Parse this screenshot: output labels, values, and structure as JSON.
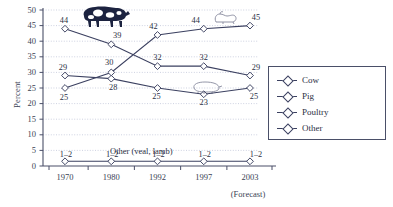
{
  "chart_data": {
    "type": "line",
    "title": "",
    "xlabel": "",
    "ylabel": "Percent",
    "categories": [
      "1970",
      "1980",
      "1992",
      "1997",
      "2003"
    ],
    "forecast_note": "(Forecast)",
    "ylim": [
      0,
      50
    ],
    "yticks": [
      0,
      5,
      10,
      15,
      20,
      25,
      30,
      35,
      40,
      45,
      50
    ],
    "grid": true,
    "legend_position": "right",
    "series": [
      {
        "name": "Cow",
        "values": [
          44,
          39,
          32,
          32,
          29
        ],
        "labels": [
          "44",
          "39",
          "32",
          "32",
          "29"
        ],
        "color": "#3b4060"
      },
      {
        "name": "Pig",
        "values": [
          29,
          28,
          25,
          23,
          25
        ],
        "labels": [
          "29",
          "28",
          "25",
          "23",
          "25"
        ],
        "color": "#3b4060"
      },
      {
        "name": "Poultry",
        "values": [
          25,
          30,
          42,
          44,
          45
        ],
        "labels": [
          "25",
          "30",
          "42",
          "44",
          "45"
        ],
        "color": "#3b4060"
      },
      {
        "name": "Other",
        "values": [
          1.5,
          1.5,
          1.5,
          1.5,
          1.5
        ],
        "labels": [
          "1–2",
          "1–2",
          "1–2",
          "1–2",
          "1–2"
        ],
        "color": "#3b4060"
      }
    ],
    "annotations": [
      {
        "name": "other-series-note",
        "text": "Other (veal, lamb)"
      }
    ],
    "clipart": [
      {
        "name": "cow-clipart"
      },
      {
        "name": "chicken-clipart"
      },
      {
        "name": "pig-clipart"
      }
    ]
  },
  "legend": {
    "items": [
      {
        "label": "Cow"
      },
      {
        "label": "Pig"
      },
      {
        "label": "Poultry"
      },
      {
        "label": "Other"
      }
    ]
  }
}
